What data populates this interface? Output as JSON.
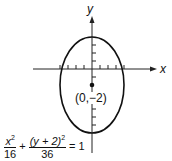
{
  "diagram": {
    "type": "ellipse-graph",
    "axes": {
      "x_label": "x",
      "y_label": "y"
    },
    "center": {
      "label": "(0,−2)",
      "x": 0,
      "y": -2
    },
    "semi_axis_x": 4,
    "semi_axis_y": 6,
    "equation": {
      "term1_num": "x",
      "term1_num_exp": "2",
      "term1_den": "16",
      "plus": "+",
      "term2_num": "(y + 2)",
      "term2_num_exp": "2",
      "term2_den": "36",
      "equals": "= 1"
    }
  }
}
